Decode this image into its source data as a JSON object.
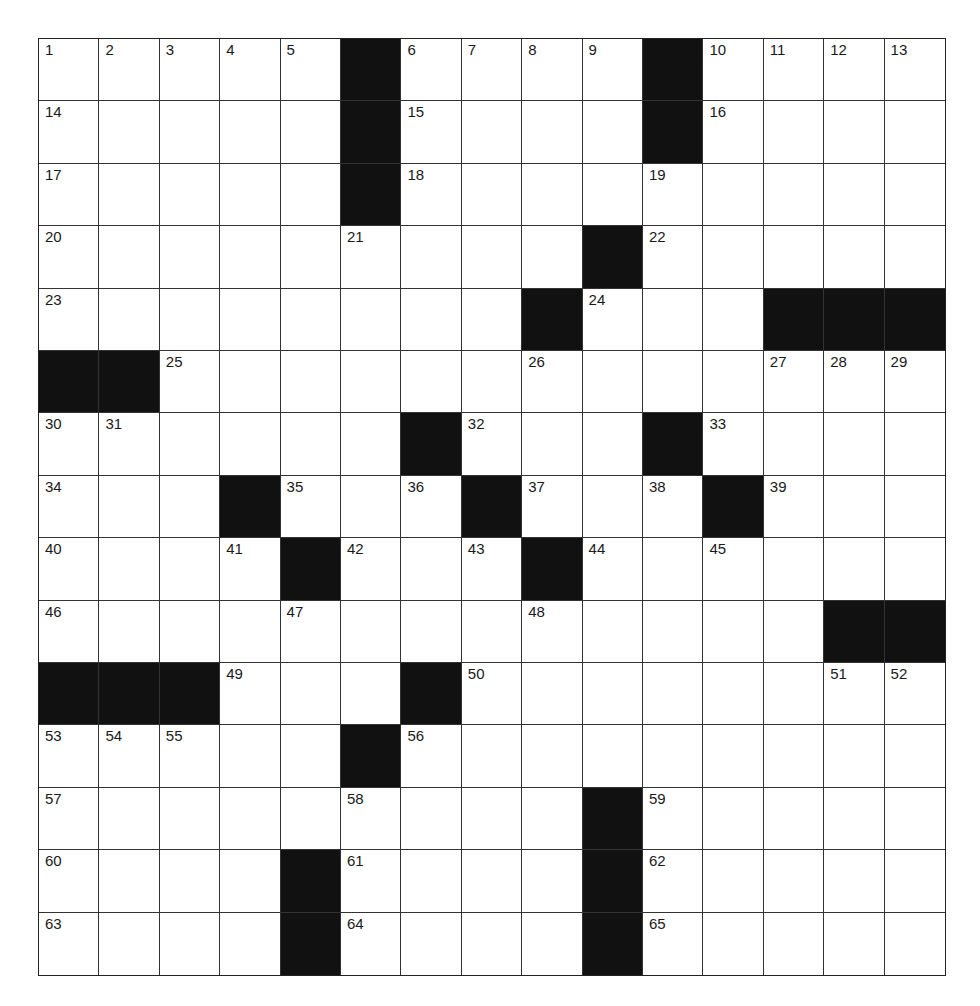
{
  "puzzle": {
    "rows": 15,
    "cols": 15,
    "grid": [
      ".....#....#....",
      ".....#....#....",
      ".....#.........",
      ".........#.....",
      "........#...###",
      "##.............",
      "......#...#....",
      "...#...#...#...",
      "....#...#......",
      ".............##",
      "###...#........",
      ".....#.........",
      ".........#.....",
      "....#....#.....",
      "....#....#....."
    ],
    "numbers": [
      [
        1,
        2,
        3,
        4,
        5,
        0,
        6,
        7,
        8,
        9,
        0,
        10,
        11,
        12,
        13
      ],
      [
        14,
        0,
        0,
        0,
        0,
        0,
        15,
        0,
        0,
        0,
        0,
        16,
        0,
        0,
        0
      ],
      [
        17,
        0,
        0,
        0,
        0,
        0,
        18,
        0,
        0,
        0,
        19,
        0,
        0,
        0,
        0
      ],
      [
        20,
        0,
        0,
        0,
        0,
        21,
        0,
        0,
        0,
        0,
        22,
        0,
        0,
        0,
        0
      ],
      [
        23,
        0,
        0,
        0,
        0,
        0,
        0,
        0,
        0,
        24,
        0,
        0,
        0,
        0,
        0
      ],
      [
        0,
        0,
        25,
        0,
        0,
        0,
        0,
        0,
        26,
        0,
        0,
        0,
        27,
        28,
        29
      ],
      [
        30,
        31,
        0,
        0,
        0,
        0,
        0,
        32,
        0,
        0,
        0,
        33,
        0,
        0,
        0
      ],
      [
        34,
        0,
        0,
        0,
        35,
        0,
        36,
        0,
        37,
        0,
        38,
        0,
        39,
        0,
        0
      ],
      [
        40,
        0,
        0,
        41,
        0,
        42,
        0,
        43,
        0,
        44,
        0,
        45,
        0,
        0,
        0
      ],
      [
        46,
        0,
        0,
        0,
        47,
        0,
        0,
        0,
        48,
        0,
        0,
        0,
        0,
        0,
        0
      ],
      [
        0,
        0,
        0,
        49,
        0,
        0,
        0,
        50,
        0,
        0,
        0,
        0,
        0,
        51,
        52
      ],
      [
        53,
        54,
        55,
        0,
        0,
        0,
        56,
        0,
        0,
        0,
        0,
        0,
        0,
        0,
        0
      ],
      [
        57,
        0,
        0,
        0,
        0,
        58,
        0,
        0,
        0,
        0,
        59,
        0,
        0,
        0,
        0
      ],
      [
        60,
        0,
        0,
        0,
        0,
        61,
        0,
        0,
        0,
        0,
        62,
        0,
        0,
        0,
        0
      ],
      [
        63,
        0,
        0,
        0,
        0,
        64,
        0,
        0,
        0,
        0,
        65,
        0,
        0,
        0,
        0
      ]
    ],
    "letters": []
  }
}
